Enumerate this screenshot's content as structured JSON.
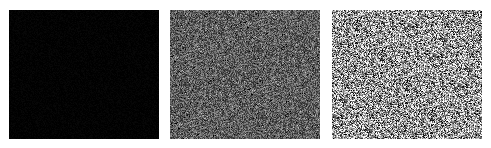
{
  "figure": {
    "background": "#ffffff",
    "panels": [
      {
        "id": "panel-1",
        "x": 9,
        "y": 10,
        "width": 150,
        "height": 129,
        "description": "near-black field with sparse faint speckles",
        "base_gray": 2,
        "noise_amplitude": 6,
        "speckle_density": 0.004
      },
      {
        "id": "panel-2",
        "x": 170,
        "y": 10,
        "width": 150,
        "height": 129,
        "description": "mid-gray fine noise texture with light and dark speckles",
        "base_gray": 95,
        "noise_amplitude": 55,
        "speckle_density": 0.08
      },
      {
        "id": "panel-3",
        "x": 332,
        "y": 10,
        "width": 150,
        "height": 129,
        "description": "bright high-contrast salt-and-pepper noise texture",
        "base_gray": 150,
        "noise_amplitude": 105,
        "speckle_density": 0.3
      }
    ]
  }
}
